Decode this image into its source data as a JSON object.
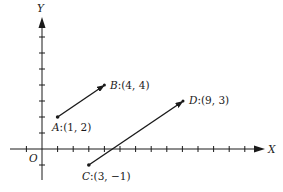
{
  "axes": {
    "x_label": "X",
    "y_label": "Y",
    "origin_label": "O",
    "x_ticks": [
      -1,
      0,
      1,
      2,
      3,
      4,
      5,
      6,
      7,
      8,
      9,
      10,
      11,
      12,
      13
    ],
    "y_ticks": [
      -1,
      0,
      1,
      2,
      3,
      4,
      5,
      6,
      7
    ]
  },
  "points": [
    {
      "name": "A",
      "coords": ":(1, 2)",
      "x": 1,
      "y": 2
    },
    {
      "name": "B",
      "coords": ":(4, 4)",
      "x": 4,
      "y": 4
    },
    {
      "name": "C",
      "coords": ":(3, −1)",
      "x": 3,
      "y": -1
    },
    {
      "name": "D",
      "coords": ":(9, 3)",
      "x": 9,
      "y": 3
    }
  ],
  "vectors": [
    {
      "from": "A",
      "to": "B"
    },
    {
      "from": "C",
      "to": "D"
    }
  ],
  "colors": {
    "ink": "#1a1a1a",
    "background": "#ffffff"
  }
}
